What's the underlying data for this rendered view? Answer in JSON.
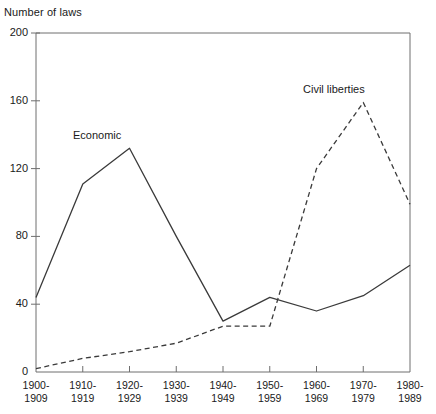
{
  "chart_data": {
    "type": "line",
    "title": "",
    "xlabel": "",
    "ylabel": "Number of laws",
    "ylim": [
      0,
      200
    ],
    "yticks": [
      0,
      40,
      80,
      120,
      160,
      200
    ],
    "grid": false,
    "legend_position": "inline-annotations",
    "categories": [
      "1900-1909",
      "1910-1919",
      "1920-1929",
      "1930-1939",
      "1940-1949",
      "1950-1959",
      "1960-1969",
      "1970-1979",
      "1980-1989"
    ],
    "series": [
      {
        "name": "Economic",
        "style": "solid",
        "color": "#3a3a3a",
        "values": [
          44,
          111,
          132,
          80,
          30,
          44,
          36,
          45,
          63
        ]
      },
      {
        "name": "Civil liberties",
        "style": "dashed",
        "color": "#3a3a3a",
        "values": [
          2,
          8,
          12,
          17,
          27,
          27,
          120,
          159,
          99
        ]
      }
    ],
    "annotations": [
      {
        "text": "Economic",
        "series": "Economic"
      },
      {
        "text": "Civil liberties",
        "series": "Civil liberties"
      }
    ]
  },
  "axes": {
    "y_axis_title": "Number of laws",
    "y_tick_labels": [
      "200",
      "160",
      "120",
      "80",
      "40",
      "0"
    ],
    "x_tick_labels": [
      {
        "top": "1900-",
        "bottom": "1909"
      },
      {
        "top": "1910-",
        "bottom": "1919"
      },
      {
        "top": "1920-",
        "bottom": "1929"
      },
      {
        "top": "1930-",
        "bottom": "1939"
      },
      {
        "top": "1940-",
        "bottom": "1949"
      },
      {
        "top": "1950-",
        "bottom": "1959"
      },
      {
        "top": "1960-",
        "bottom": "1969"
      },
      {
        "top": "1970-",
        "bottom": "1979"
      },
      {
        "top": "1980-",
        "bottom": "1989"
      }
    ]
  },
  "series_labels": {
    "economic": "Economic",
    "civil_liberties": "Civil liberties"
  },
  "colors": {
    "line": "#3a3a3a",
    "axis": "#6e6e6e",
    "text": "#1a1a1a",
    "background": "#ffffff"
  }
}
